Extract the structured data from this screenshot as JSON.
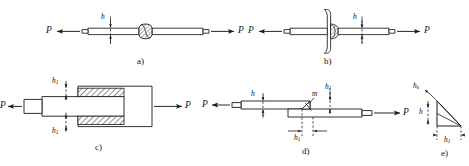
{
  "figure": {
    "background": "#ffffff",
    "line_color": "#1a1a1a",
    "hatch_color": "#3a3a3a"
  },
  "panels": [
    {
      "id": "a",
      "caption": "a)",
      "description": "butt weld with raised bead between two plates",
      "force_left": "P",
      "force_right": "P",
      "dimensions": [
        {
          "name": "weld-thickness",
          "label": "h",
          "label_base": "h",
          "label_sub": ""
        }
      ]
    },
    {
      "id": "b",
      "caption": "b)",
      "description": "T-joint / flanged plate fillet weld",
      "force_left": "P",
      "force_right": "P",
      "dimensions": [
        {
          "name": "weld-thickness",
          "label": "h",
          "label_base": "h",
          "label_sub": ""
        }
      ]
    },
    {
      "id": "c",
      "caption": "c)",
      "description": "socket / slip-on joint with two hatched fillet welds",
      "force_left": "P",
      "force_right": "P",
      "dimensions": [
        {
          "name": "weld-leg-top",
          "label": "h1",
          "label_base": "h",
          "label_sub": "1"
        },
        {
          "name": "weld-leg-bottom",
          "label": "h1",
          "label_base": "h",
          "label_sub": "1"
        }
      ]
    },
    {
      "id": "d",
      "caption": "d)",
      "description": "lap joint with fillet weld, throat section m",
      "force_left": "P",
      "force_right": "P",
      "dimensions": [
        {
          "name": "plate-thickness",
          "label": "h",
          "label_base": "h",
          "label_sub": ""
        },
        {
          "name": "weld-leg-vertical",
          "label": "h1",
          "label_base": "h",
          "label_sub": "1"
        },
        {
          "name": "weld-leg-horizontal",
          "label": "h1",
          "label_base": "h",
          "label_sub": "1"
        }
      ],
      "annotations": [
        {
          "name": "throat-section",
          "label": "m"
        }
      ]
    },
    {
      "id": "e",
      "caption": "e)",
      "description": "fillet weld cross-section triangle showing throat he, leg h and leg h1",
      "dimensions": [
        {
          "name": "weld-throat",
          "label": "he",
          "label_base": "h",
          "label_sub": "e"
        },
        {
          "name": "weld-leg-vertical",
          "label": "h",
          "label_base": "h",
          "label_sub": ""
        },
        {
          "name": "weld-leg-horizontal",
          "label": "h1",
          "label_base": "h",
          "label_sub": "1"
        }
      ]
    }
  ],
  "labels": {
    "a_P_left": "P",
    "a_P_right": "P",
    "a_h": "h",
    "a_caption": "a)",
    "b_P_left": "P",
    "b_P_right": "P",
    "b_h": "h",
    "b_caption": "b)",
    "c_P_left": "P",
    "c_P_right": "P",
    "c_caption": "c)",
    "d_P_left": "P",
    "d_P_right": "P",
    "d_m": "m",
    "d_caption": "d)",
    "e_caption": "e)"
  }
}
